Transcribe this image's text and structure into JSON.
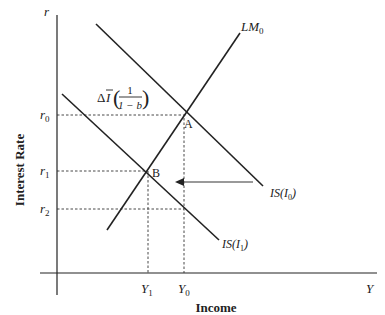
{
  "diagram": {
    "type": "IS-LM",
    "colors": {
      "ink": "#222222",
      "arrow": "#777777",
      "background": "#ffffff"
    },
    "axes": {
      "y_axis_symbol": "r",
      "x_axis_symbol": "Y",
      "y_axis_title": "Interest Rate",
      "x_axis_title": "Income"
    },
    "y_ticks": [
      {
        "base": "r",
        "sub": "0"
      },
      {
        "base": "r",
        "sub": "1"
      },
      {
        "base": "r",
        "sub": "2"
      }
    ],
    "x_ticks": [
      {
        "base": "Y",
        "sub": "1"
      },
      {
        "base": "Y",
        "sub": "0"
      }
    ],
    "curves": {
      "lm0": {
        "base": "LM",
        "sub": "0"
      },
      "is0": {
        "label": "IS(I",
        "sub": "0",
        "close": ")"
      },
      "is1": {
        "label": "IS(I",
        "sub": "1",
        "close": ")"
      }
    },
    "points": {
      "a": "A",
      "b": "B"
    },
    "shift_annotation": {
      "delta": "Δ",
      "ibar": "I",
      "numerator": "1",
      "denominator": "1 − b"
    }
  }
}
